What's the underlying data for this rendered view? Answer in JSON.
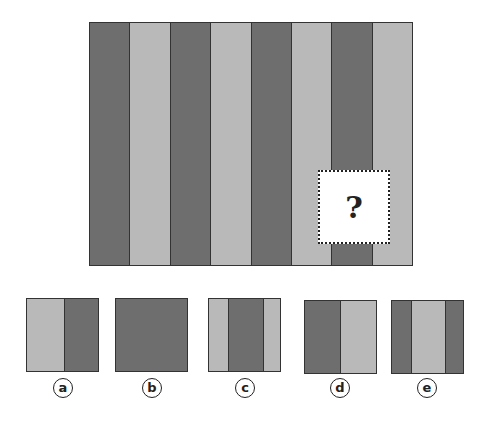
{
  "colors": {
    "dark": "#6e6e6e",
    "light": "#b9b9b9",
    "border": "#333333"
  },
  "puzzle": {
    "stripes": [
      "dark",
      "light",
      "dark",
      "light",
      "dark",
      "light",
      "dark",
      "light"
    ],
    "question_mark": "?"
  },
  "options": [
    {
      "label": "a",
      "segments": [
        {
          "tone": "light",
          "w": 38
        },
        {
          "tone": "dark",
          "w": 35
        }
      ]
    },
    {
      "label": "b",
      "segments": [
        {
          "tone": "dark",
          "w": 73
        }
      ]
    },
    {
      "label": "c",
      "segments": [
        {
          "tone": "light",
          "w": 20
        },
        {
          "tone": "dark",
          "w": 35
        },
        {
          "tone": "light",
          "w": 18
        }
      ]
    },
    {
      "label": "d",
      "segments": [
        {
          "tone": "dark",
          "w": 36
        },
        {
          "tone": "light",
          "w": 37
        }
      ]
    },
    {
      "label": "e",
      "segments": [
        {
          "tone": "dark",
          "w": 20
        },
        {
          "tone": "light",
          "w": 34
        },
        {
          "tone": "dark",
          "w": 19
        }
      ]
    }
  ]
}
